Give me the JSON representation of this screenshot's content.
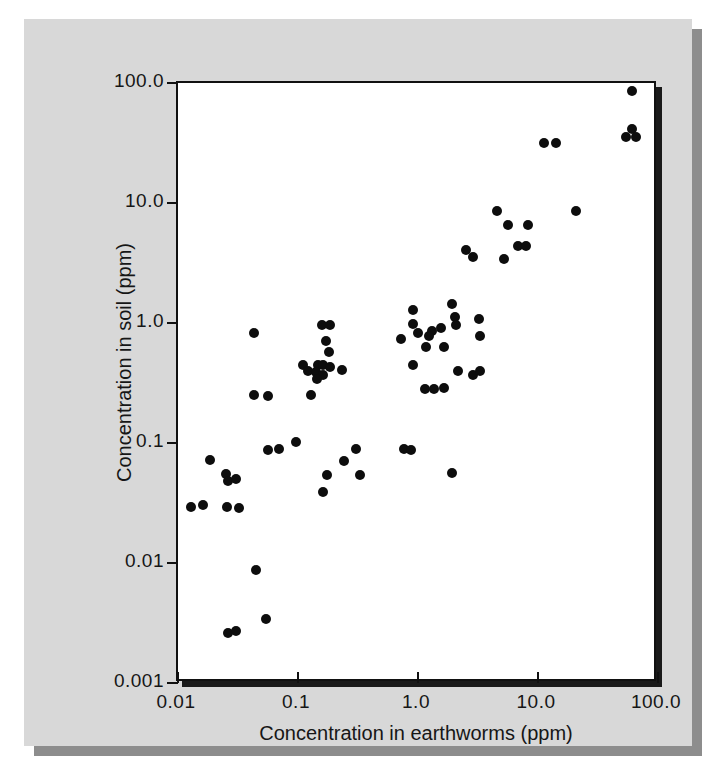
{
  "figure": {
    "background_color": "#d8d8d8",
    "plot_background_color": "#ffffff",
    "frame_color": "#111111",
    "marker_color": "#0d0d0d"
  },
  "axes": {
    "x_title": "Concentration in earthworms (ppm)",
    "y_title": "Concentration in soil (ppm)",
    "x_ticks": [
      "0.01",
      "0.1",
      "1.0",
      "10.0",
      "100.0"
    ],
    "y_ticks": [
      "100.0",
      "10.0",
      "1.0",
      "0.1",
      "0.01",
      "0.001"
    ]
  },
  "chart_data": {
    "type": "scatter",
    "title": "",
    "xlabel": "Concentration in earthworms (ppm)",
    "ylabel": "Concentration in soil (ppm)",
    "xscale": "log",
    "yscale": "log",
    "xlim": [
      0.01,
      100.0
    ],
    "ylim": [
      0.001,
      100.0
    ],
    "xticks": [
      0.01,
      0.1,
      1.0,
      10.0,
      100.0
    ],
    "yticks": [
      0.001,
      0.01,
      0.1,
      1.0,
      10.0,
      100.0
    ],
    "grid": false,
    "legend": false,
    "marker": "filled-circle",
    "series": [
      {
        "name": "samples",
        "points": [
          [
            0.0129,
            0.0292
          ],
          [
            0.0162,
            0.0304
          ],
          [
            0.0257,
            0.0292
          ],
          [
            0.0324,
            0.0285
          ],
          [
            0.0186,
            0.0722
          ],
          [
            0.0251,
            0.0556
          ],
          [
            0.0263,
            0.0478
          ],
          [
            0.0302,
            0.0501
          ],
          [
            0.0447,
            0.0087
          ],
          [
            0.0263,
            0.0026
          ],
          [
            0.0302,
            0.0027
          ],
          [
            0.0537,
            0.0034
          ],
          [
            0.0427,
            0.832
          ],
          [
            0.0427,
            0.251
          ],
          [
            0.0562,
            0.245
          ],
          [
            0.0562,
            0.0871
          ],
          [
            0.0692,
            0.0891
          ],
          [
            0.0955,
            0.102
          ],
          [
            0.1096,
            0.447
          ],
          [
            0.1585,
            0.955
          ],
          [
            0.1862,
            0.955
          ],
          [
            0.1698,
            0.708
          ],
          [
            0.182,
            0.575
          ],
          [
            0.1479,
            0.447
          ],
          [
            0.1622,
            0.447
          ],
          [
            0.1862,
            0.427
          ],
          [
            0.2344,
            0.407
          ],
          [
            0.1202,
            0.398
          ],
          [
            0.1413,
            0.389
          ],
          [
            0.1622,
            0.372
          ],
          [
            0.1445,
            0.339
          ],
          [
            0.1288,
            0.251
          ],
          [
            0.1738,
            0.0537
          ],
          [
            0.1622,
            0.0389
          ],
          [
            0.2399,
            0.0708
          ],
          [
            0.3311,
            0.0537
          ],
          [
            0.302,
            0.0891
          ],
          [
            0.7586,
            0.0891
          ],
          [
            0.912,
            1.288
          ],
          [
            0.912,
            0.977
          ],
          [
            1.0,
            0.832
          ],
          [
            1.318,
            0.851
          ],
          [
            1.549,
            0.912
          ],
          [
            1.23,
            0.776
          ],
          [
            1.175,
            0.631
          ],
          [
            0.724,
            0.741
          ],
          [
            0.912,
            0.447
          ],
          [
            1.66,
            0.631
          ],
          [
            1.148,
            0.282
          ],
          [
            1.349,
            0.282
          ],
          [
            1.66,
            0.288
          ],
          [
            0.871,
            0.0871
          ],
          [
            1.905,
            1.445
          ],
          [
            2.042,
            1.122
          ],
          [
            3.236,
            1.072
          ],
          [
            2.089,
            0.955
          ],
          [
            2.138,
            0.398
          ],
          [
            2.884,
            0.372
          ],
          [
            3.311,
            0.398
          ],
          [
            3.311,
            0.776
          ],
          [
            1.905,
            0.0562
          ],
          [
            2.512,
            4.074
          ],
          [
            2.884,
            3.548
          ],
          [
            4.571,
            8.511
          ],
          [
            5.623,
            6.607
          ],
          [
            5.248,
            3.388
          ],
          [
            6.761,
            4.365
          ],
          [
            7.943,
            4.365
          ],
          [
            8.318,
            6.607
          ],
          [
            11.22,
            31.62
          ],
          [
            14.13,
            31.62
          ],
          [
            20.89,
            8.511
          ],
          [
            60.26,
            85.11
          ],
          [
            60.26,
            41.69
          ],
          [
            53.7,
            35.48
          ],
          [
            66.07,
            35.48
          ]
        ]
      }
    ]
  }
}
